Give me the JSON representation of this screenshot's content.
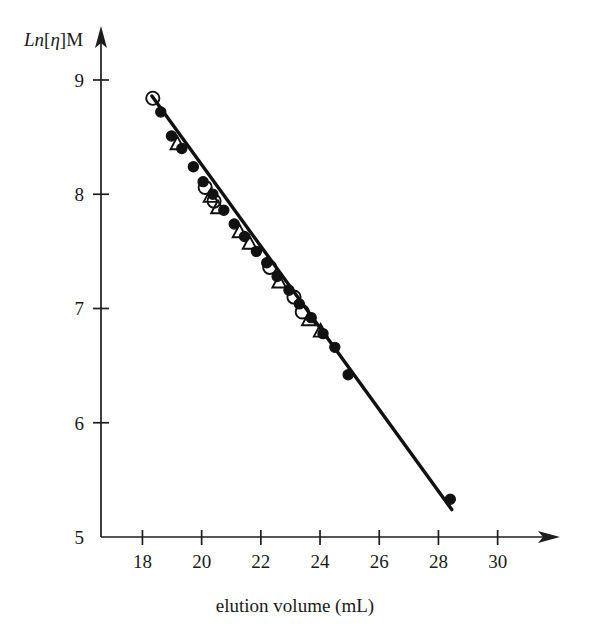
{
  "chart_data": {
    "type": "scatter",
    "title": "",
    "subtitle": "",
    "xlabel": "elution volume (mL)",
    "ylabel": "Ln[η]M",
    "ylabel_parts": {
      "italic": "Ln",
      "bracket_open": "[",
      "greek": "η",
      "bracket_close": "]",
      "upright": "M"
    },
    "xlim": [
      16.6,
      31.6
    ],
    "ylim": [
      5.0,
      9.35
    ],
    "xticks": [
      18,
      20,
      22,
      24,
      26,
      28,
      30
    ],
    "xtick_labels": [
      "18",
      "20",
      "22",
      "24",
      "26",
      "28",
      "30"
    ],
    "yticks": [
      5,
      6,
      7,
      8,
      9
    ],
    "ytick_labels": [
      "5",
      "6",
      "7",
      "8",
      "9"
    ],
    "grid": false,
    "legend": false,
    "legend_position": "none",
    "axis_style": "arrow-terminated L-shaped axes",
    "annotations": [],
    "trend_line": {
      "name": "universal calibration line",
      "x": [
        18.32,
        28.45
      ],
      "y": [
        8.86,
        5.24
      ],
      "color": "#111111"
    },
    "series": [
      {
        "name": "filled circles",
        "marker": "filled-circle",
        "color": "#111111",
        "points": [
          {
            "x": 18.62,
            "y": 8.72
          },
          {
            "x": 18.98,
            "y": 8.51
          },
          {
            "x": 19.33,
            "y": 8.4
          },
          {
            "x": 19.72,
            "y": 8.24
          },
          {
            "x": 20.05,
            "y": 8.11
          },
          {
            "x": 20.38,
            "y": 8.0
          },
          {
            "x": 20.75,
            "y": 7.86
          },
          {
            "x": 21.1,
            "y": 7.74
          },
          {
            "x": 21.45,
            "y": 7.63
          },
          {
            "x": 21.85,
            "y": 7.5
          },
          {
            "x": 22.2,
            "y": 7.4
          },
          {
            "x": 22.55,
            "y": 7.28
          },
          {
            "x": 22.95,
            "y": 7.16
          },
          {
            "x": 23.3,
            "y": 7.04
          },
          {
            "x": 23.7,
            "y": 6.92
          },
          {
            "x": 24.1,
            "y": 6.78
          },
          {
            "x": 24.5,
            "y": 6.66
          },
          {
            "x": 24.95,
            "y": 6.42
          },
          {
            "x": 28.4,
            "y": 5.33
          }
        ]
      },
      {
        "name": "open circles",
        "marker": "open-circle",
        "color": "#111111",
        "points": [
          {
            "x": 18.35,
            "y": 8.84
          },
          {
            "x": 20.12,
            "y": 8.06
          },
          {
            "x": 20.42,
            "y": 7.94
          },
          {
            "x": 22.3,
            "y": 7.36
          },
          {
            "x": 23.12,
            "y": 7.1
          },
          {
            "x": 23.4,
            "y": 6.97
          }
        ]
      },
      {
        "name": "open triangles",
        "marker": "open-triangle",
        "color": "#111111",
        "points": [
          {
            "x": 19.18,
            "y": 8.44
          },
          {
            "x": 20.3,
            "y": 7.98
          },
          {
            "x": 20.55,
            "y": 7.88
          },
          {
            "x": 21.28,
            "y": 7.67
          },
          {
            "x": 21.62,
            "y": 7.57
          },
          {
            "x": 22.62,
            "y": 7.23
          },
          {
            "x": 23.62,
            "y": 6.9
          },
          {
            "x": 24.02,
            "y": 6.8
          }
        ]
      }
    ]
  },
  "figure": {
    "background_color": "#ffffff",
    "ink_color": "#111111",
    "y_axis_label": "Ln[η]M",
    "x_axis_label": "elution volume (mL)"
  }
}
